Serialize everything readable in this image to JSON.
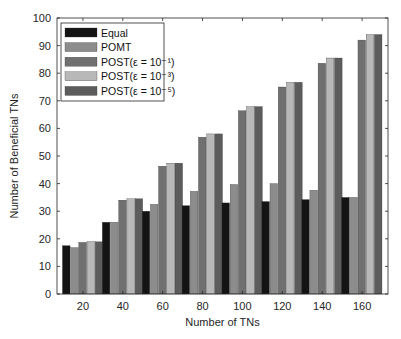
{
  "chart_data": {
    "type": "bar",
    "title": "",
    "xlabel": "Number of TNs",
    "ylabel": "Number of Beneficial TNs",
    "categories": [
      "20",
      "40",
      "60",
      "80",
      "100",
      "120",
      "140",
      "160"
    ],
    "ylim": [
      0,
      100
    ],
    "yticks": [
      0,
      10,
      20,
      30,
      40,
      50,
      60,
      70,
      80,
      90,
      100
    ],
    "grid": false,
    "legend_position": "upper left",
    "series": [
      {
        "name": "Equal",
        "color": "#141414",
        "values": [
          17.5,
          26,
          30,
          32,
          33,
          33.5,
          34.2,
          35
        ]
      },
      {
        "name": "POMT",
        "color": "#8c8c8c",
        "values": [
          16.8,
          26,
          32.5,
          37.2,
          39.7,
          40,
          37.6,
          35
        ]
      },
      {
        "name": "POST(ε = 10⁻¹)",
        "color": "#707070",
        "values": [
          18.7,
          34,
          46.3,
          56.8,
          66.4,
          75,
          83.6,
          92
        ]
      },
      {
        "name": "POST(ε = 10⁻³)",
        "color": "#b8b8b8",
        "values": [
          19,
          34.5,
          47.4,
          58,
          67.9,
          76.7,
          85.5,
          94
        ]
      },
      {
        "name": "POST(ε = 10⁻⁵)",
        "color": "#5c5c5c",
        "values": [
          18.9,
          34.5,
          47.4,
          58,
          67.9,
          76.7,
          85.5,
          94
        ]
      }
    ]
  }
}
